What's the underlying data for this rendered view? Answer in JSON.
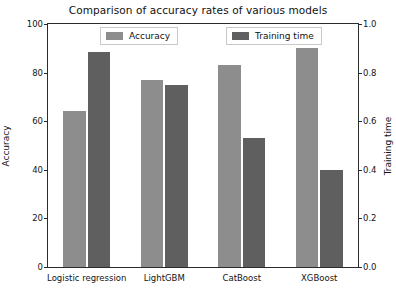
{
  "chart_data": {
    "type": "bar",
    "title": "Comparison of accuracy rates of various models",
    "xlabel": "",
    "ylabel": "Accuracy",
    "y2label": "Training time",
    "categories": [
      "Logistic regression",
      "LightGBM",
      "CatBoost",
      "XGBoost"
    ],
    "series": [
      {
        "name": "Accuracy",
        "axis": "left",
        "color": "#8d8d8d",
        "values": [
          64,
          77,
          83,
          90
        ]
      },
      {
        "name": "Training time",
        "axis": "right",
        "color": "#5f5f5f",
        "values": [
          0.885,
          0.75,
          0.53,
          0.4
        ]
      }
    ],
    "ylim": [
      0,
      100
    ],
    "y2lim": [
      0.0,
      1.0
    ],
    "yticks": [
      0,
      20,
      40,
      60,
      80,
      100
    ],
    "ytick_labels": [
      "0",
      "20",
      "40",
      "60",
      "80",
      "100"
    ],
    "y2ticks": [
      0.0,
      0.2,
      0.4,
      0.6,
      0.8,
      1.0
    ],
    "y2tick_labels": [
      "0.0",
      "0.2",
      "0.4",
      "0.6",
      "0.8",
      "1.0"
    ],
    "grid": false,
    "legend_position": "upper center",
    "legend_entries": [
      "Accuracy",
      "Training time"
    ]
  }
}
